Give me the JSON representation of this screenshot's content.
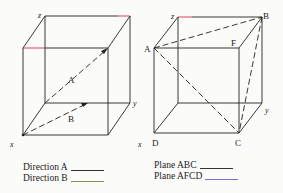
{
  "figure": {
    "left_cube": {
      "axis_labels": {
        "z": "z",
        "y": "y",
        "x": "x"
      },
      "vector_labels": {
        "A": "A",
        "B": "B"
      }
    },
    "right_cube": {
      "axis_labels": {
        "z": "z",
        "y": "y",
        "x": "x"
      },
      "point_labels": {
        "A": "A",
        "B": "B",
        "F": "F",
        "C": "C",
        "D": "D"
      }
    }
  },
  "legend": {
    "left": [
      {
        "label": "Direction A",
        "color": "#333333"
      },
      {
        "label": "Direction B",
        "color": "#8a8a55"
      }
    ],
    "right": [
      {
        "label": "Plane ABC",
        "color": "#333333"
      },
      {
        "label": "Plane AFCD",
        "color": "#7a6fd0"
      }
    ]
  },
  "colors": {
    "edge": "#222222",
    "red_edge": "#d03040"
  }
}
